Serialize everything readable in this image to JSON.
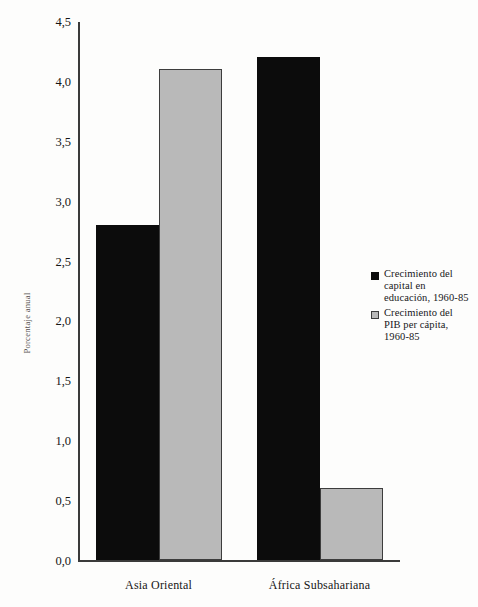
{
  "chart_data": {
    "type": "bar",
    "title": "",
    "subtitle": "",
    "xlabel": "",
    "ylabel": "Porcentaje anual",
    "categories": [
      "Asia Oriental",
      "África Subsahariana"
    ],
    "series": [
      {
        "name": "Crecimiento del capital en educación, 1960-85",
        "name_lines": [
          "Crecimiento del",
          "capital en",
          "educación, 1960-85"
        ],
        "color": "#0c0c0c",
        "values": [
          2.8,
          4.2
        ]
      },
      {
        "name": "Crecimiento del PIB per cápita, 1960-85",
        "name_lines": [
          "Crecimiento del",
          "PIB per cápita,",
          "1960-85"
        ],
        "color": "#b9b9b9",
        "values": [
          4.1,
          0.6
        ]
      }
    ],
    "ylim": [
      0.0,
      4.5
    ],
    "ytick_values": [
      0.0,
      0.5,
      1.0,
      1.5,
      2.0,
      2.5,
      3.0,
      3.5,
      4.0,
      4.5
    ],
    "ytick_labels": [
      "0,0",
      "0,5",
      "1,0",
      "1,5",
      "2,0",
      "2,5",
      "3,0",
      "3,5",
      "4,0",
      "4,5"
    ],
    "grid": false,
    "legend_position": "right-middle",
    "decimal_separator": ","
  }
}
